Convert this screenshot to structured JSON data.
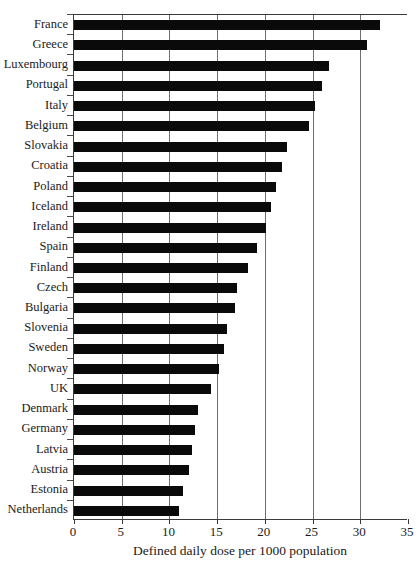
{
  "chart_data": {
    "type": "bar",
    "orientation": "horizontal",
    "title": "",
    "subtitle": "",
    "xlabel": "Defined daily dose per 1000 population",
    "ylabel": "",
    "xlim": [
      0,
      35
    ],
    "xticks": [
      0,
      5,
      10,
      15,
      20,
      25,
      30,
      35
    ],
    "xtick_labels": [
      "0",
      "5",
      "10",
      "15",
      "20",
      "25",
      "30",
      "35"
    ],
    "grid": "vertical",
    "gridlines_at": [
      5,
      10,
      15,
      20,
      25,
      30
    ],
    "legend": null,
    "bar_color": "#0a0a0a",
    "categories": [
      "France",
      "Greece",
      "Luxembourg",
      "Portugal",
      "Italy",
      "Belgium",
      "Slovakia",
      "Croatia",
      "Poland",
      "Iceland",
      "Ireland",
      "Spain",
      "Finland",
      "Czech",
      "Bulgaria",
      "Slovenia",
      "Sweden",
      "Norway",
      "UK",
      "Denmark",
      "Germany",
      "Latvia",
      "Austria",
      "Estonia",
      "Netherlands"
    ],
    "values": [
      32.1,
      30.7,
      26.7,
      26.0,
      25.3,
      24.6,
      22.3,
      21.8,
      21.2,
      20.6,
      20.1,
      19.2,
      18.2,
      17.1,
      16.9,
      16.0,
      15.7,
      15.2,
      14.4,
      13.0,
      12.7,
      12.4,
      12.0,
      11.4,
      11.0
    ]
  }
}
